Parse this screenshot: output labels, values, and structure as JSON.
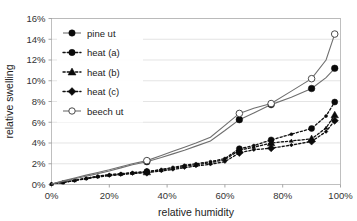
{
  "chart_data": {
    "type": "line",
    "title": "",
    "xlabel": "relative humidity",
    "ylabel": "relative swelling",
    "xlim": [
      0,
      100
    ],
    "ylim": [
      0,
      16
    ],
    "xtick_labels": [
      "0%",
      "20%",
      "40%",
      "60%",
      "80%",
      "100%"
    ],
    "xtick_values": [
      0,
      20,
      40,
      60,
      80,
      100
    ],
    "ytick_labels": [
      "0%",
      "2%",
      "4%",
      "6%",
      "8%",
      "10%",
      "12%",
      "14%",
      "16%"
    ],
    "ytick_values": [
      0,
      2,
      4,
      6,
      8,
      10,
      12,
      14,
      16
    ],
    "grid": "horizontal",
    "legend_position": "top-left",
    "x": [
      0,
      4,
      8,
      12,
      16,
      20,
      24,
      28,
      33,
      38,
      42,
      46,
      50,
      55,
      60,
      65,
      70,
      76,
      83,
      90,
      95,
      98
    ],
    "series": [
      {
        "name": "pine ut",
        "line_style": "solid",
        "marker": "filled-circle",
        "color": "#6f6f6f",
        "marker_color": "#0a0a0a",
        "values": [
          0.05,
          0.3,
          0.55,
          0.8,
          1.05,
          1.3,
          1.6,
          1.9,
          2.2,
          2.6,
          2.95,
          3.3,
          3.7,
          4.2,
          5.2,
          6.25,
          6.9,
          7.7,
          8.4,
          9.25,
          10.3,
          11.2
        ]
      },
      {
        "name": "heat (a)",
        "line_style": "dashed",
        "marker": "filled-circle",
        "color": "#111111",
        "marker_color": "#0a0a0a",
        "values": [
          0.05,
          0.2,
          0.4,
          0.6,
          0.8,
          0.95,
          1.05,
          1.15,
          1.25,
          1.45,
          1.65,
          1.85,
          2.0,
          2.2,
          2.5,
          3.45,
          3.75,
          4.3,
          4.85,
          5.4,
          6.6,
          7.95
        ]
      },
      {
        "name": "heat (b)",
        "line_style": "dashed",
        "marker": "filled-triangle",
        "color": "#111111",
        "marker_color": "#0a0a0a",
        "values": [
          0.05,
          0.2,
          0.4,
          0.6,
          0.78,
          0.92,
          1.0,
          1.1,
          1.2,
          1.38,
          1.55,
          1.75,
          1.9,
          2.1,
          2.4,
          3.3,
          3.6,
          4.0,
          4.2,
          4.4,
          5.45,
          6.7
        ]
      },
      {
        "name": "heat (c)",
        "line_style": "dashed",
        "marker": "filled-diamond",
        "color": "#111111",
        "marker_color": "#0a0a0a",
        "values": [
          0.05,
          0.2,
          0.38,
          0.56,
          0.72,
          0.85,
          0.95,
          1.05,
          1.15,
          1.3,
          1.45,
          1.62,
          1.78,
          1.95,
          2.2,
          3.05,
          3.35,
          3.5,
          3.8,
          4.15,
          5.1,
          6.15
        ]
      },
      {
        "name": "beech ut",
        "line_style": "solid",
        "marker": "open-circle",
        "color": "#6f6f6f",
        "marker_color": "#ffffff",
        "values": [
          0.05,
          0.35,
          0.62,
          0.9,
          1.15,
          1.42,
          1.72,
          2.0,
          2.3,
          2.8,
          3.2,
          3.6,
          4.0,
          4.55,
          5.7,
          6.85,
          7.35,
          7.8,
          9.0,
          10.2,
          12.0,
          14.5
        ]
      }
    ],
    "legend_entries": [
      {
        "label": "pine ut",
        "marker": "filled-circle",
        "line_style": "solid"
      },
      {
        "label": "heat (a)",
        "marker": "filled-circle",
        "line_style": "dashed"
      },
      {
        "label": "heat (b)",
        "marker": "filled-triangle",
        "line_style": "dashed"
      },
      {
        "label": "heat (c)",
        "marker": "filled-diamond",
        "line_style": "dashed"
      },
      {
        "label": "beech ut",
        "marker": "open-circle",
        "line_style": "solid"
      }
    ],
    "colors": {
      "solid_line": "#6f6f6f",
      "dashed_line": "#111111",
      "gridline": "#d9d9d9",
      "axis": "#909090",
      "text": "#222222",
      "background": "#ffffff"
    }
  }
}
